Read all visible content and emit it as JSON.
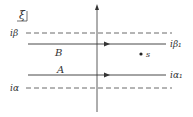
{
  "diagram": {
    "plane_label": "ξ",
    "lines": [
      {
        "id": "dashed-top",
        "label": "iβ",
        "style": "dashed",
        "y": 33
      },
      {
        "id": "contour-B",
        "label": "B",
        "end_label": "iβ₁",
        "style": "solid",
        "y": 44
      },
      {
        "id": "contour-A",
        "label": "A",
        "end_label": "iα₁",
        "style": "solid",
        "y": 75
      },
      {
        "id": "dashed-bottom",
        "label": "iα",
        "style": "dashed",
        "y": 88
      }
    ],
    "point": {
      "label": "s"
    },
    "colors": {
      "line": "#333333",
      "dashed": "#444444",
      "background": "#ffffff"
    }
  }
}
